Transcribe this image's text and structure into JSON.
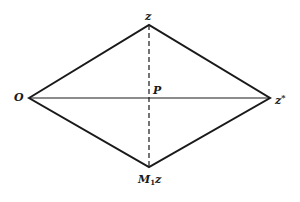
{
  "diagram": {
    "type": "rhombus-geometry",
    "colors": {
      "background": "#ffffff",
      "stroke": "#1a1a1a"
    },
    "vertices": {
      "O": {
        "x": 29,
        "y": 98
      },
      "z": {
        "x": 149,
        "y": 25
      },
      "z_star": {
        "x": 270,
        "y": 98
      },
      "M1z": {
        "x": 149,
        "y": 167
      },
      "P": {
        "x": 149,
        "y": 98
      }
    },
    "labels": {
      "top": "z",
      "left": "O",
      "center": "P",
      "right_base": "z",
      "right_sup": "*",
      "bottom_base": "M",
      "bottom_sub": "1",
      "bottom_tail": "z"
    },
    "edges": [
      {
        "from": "O",
        "to": "z",
        "style": "solid"
      },
      {
        "from": "z",
        "to": "z_star",
        "style": "solid"
      },
      {
        "from": "z_star",
        "to": "M1z",
        "style": "solid"
      },
      {
        "from": "M1z",
        "to": "O",
        "style": "solid"
      },
      {
        "from": "O",
        "to": "z_star",
        "style": "solid"
      },
      {
        "from": "z",
        "to": "M1z",
        "style": "dashed"
      }
    ]
  }
}
